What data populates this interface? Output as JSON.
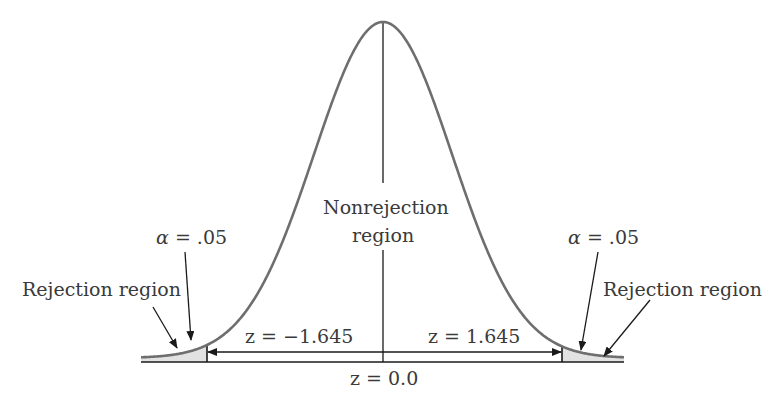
{
  "chart_data": {
    "type": "line",
    "title": "",
    "distribution": "standard normal (z)",
    "mean": 0.0,
    "critical_values": [
      -1.645,
      1.645
    ],
    "alpha_per_tail": 0.05,
    "xlabel": "z",
    "ylabel": "",
    "grid": false,
    "legend": "none",
    "regions": [
      {
        "name": "Rejection region",
        "side": "left",
        "range": [
          "-inf",
          -1.645
        ],
        "shaded": true,
        "area": 0.05
      },
      {
        "name": "Nonrejection region",
        "side": "center",
        "range": [
          -1.645,
          1.645
        ],
        "shaded": false
      },
      {
        "name": "Rejection region",
        "side": "right",
        "range": [
          1.645,
          "inf"
        ],
        "shaded": true,
        "area": 0.05
      }
    ],
    "annotations": [
      "α = .05",
      "Rejection region",
      "Nonrejection region",
      "z = −1.645",
      "z = 1.645",
      "z = 0.0",
      "α = .05",
      "Rejection region"
    ]
  },
  "labels": {
    "left_alpha": "α = .05",
    "left_rejection": "Rejection region",
    "nonrejection_line1": "Nonrejection",
    "nonrejection_line2": "region",
    "left_z": "z = −1.645",
    "right_z": "z = 1.645",
    "center_z": "z = 0.0",
    "right_alpha": "α = .05",
    "right_rejection": "Rejection region"
  },
  "colors": {
    "curve": "#6e6e6e",
    "line": "#1a1a1a",
    "shade": "#e2e2e2",
    "text": "#3a3a3a"
  },
  "geometry": {
    "center_x": 383,
    "baseline_y": 362,
    "peak_y": 22,
    "sigma_px": 69,
    "x_start": 141,
    "x_end": 624,
    "left_crit_x": 207,
    "right_crit_x": 562,
    "arrow_y": 352
  }
}
